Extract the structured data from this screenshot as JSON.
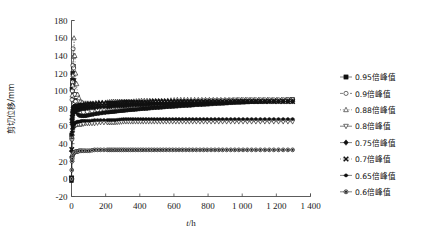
{
  "chart_data": {
    "type": "line",
    "title": "",
    "xlabel": "t/h",
    "ylabel": "剪切位移/mm",
    "xlim": [
      0,
      1400
    ],
    "ylim": [
      -20,
      180
    ],
    "xticks": [
      0,
      200,
      400,
      600,
      800,
      1000,
      1200,
      1400
    ],
    "xtick_labels": [
      "0",
      "200",
      "400",
      "600",
      "800",
      "1 000",
      "1 200",
      "1 400"
    ],
    "yticks": [
      -20,
      0,
      20,
      40,
      60,
      80,
      100,
      120,
      140,
      160,
      180
    ],
    "ytick_labels": [
      "-20",
      "0",
      "20",
      "40",
      "60",
      "80",
      "100",
      "120",
      "140",
      "160",
      "180"
    ],
    "grid": false,
    "legend_position": "right",
    "series": [
      {
        "name": "0.95倍峰值",
        "marker": "filled-square",
        "line": "solid",
        "x": [
          0,
          3,
          6,
          10,
          16,
          24,
          34,
          46,
          60,
          80,
          105,
          135,
          170,
          210,
          255,
          305,
          360,
          420,
          485,
          555,
          630,
          710,
          795,
          885,
          980,
          1080,
          1185,
          1295
        ],
        "y": [
          -2,
          102,
          112,
          128,
          96,
          82,
          76,
          73,
          72,
          72,
          73,
          74,
          75,
          76,
          77,
          78,
          79,
          80,
          81,
          82,
          83,
          84,
          85,
          86,
          87,
          88,
          89,
          90
        ]
      },
      {
        "name": "0.9倍峰值",
        "marker": "open-circle",
        "line": "dashed",
        "x": [
          0,
          3,
          6,
          10,
          16,
          24,
          34,
          46,
          60,
          80,
          105,
          135,
          170,
          210,
          255,
          305,
          360,
          420,
          485,
          555,
          630,
          710,
          795,
          885,
          980,
          1080,
          1185,
          1295
        ],
        "y": [
          0,
          90,
          110,
          148,
          104,
          88,
          80,
          77,
          76,
          76,
          77,
          78,
          79,
          80,
          81,
          82,
          83,
          84,
          85,
          86,
          87,
          88,
          89,
          89,
          90,
          90,
          90,
          90
        ]
      },
      {
        "name": "0.88倍峰值",
        "marker": "open-triangle-up",
        "line": "dotted",
        "x": [
          0,
          4,
          9,
          15,
          24,
          36,
          52,
          72,
          96,
          125,
          160,
          200,
          245,
          295,
          350,
          410,
          475,
          545,
          620,
          700,
          785,
          875,
          970,
          1070,
          1175,
          1285
        ],
        "y": [
          2,
          95,
          118,
          160,
          120,
          96,
          88,
          86,
          86,
          86,
          87,
          87,
          88,
          88,
          88,
          89,
          89,
          89,
          90,
          90,
          90,
          90,
          90,
          90,
          90,
          90
        ]
      },
      {
        "name": "0.8倍峰值",
        "marker": "open-triangle-down",
        "line": "solid",
        "x": [
          0,
          3,
          6,
          10,
          16,
          24,
          34,
          46,
          60,
          80,
          105,
          135,
          170,
          210,
          255,
          305,
          360,
          420,
          485,
          555,
          630,
          710,
          795,
          885,
          980,
          1080,
          1185,
          1295
        ],
        "y": [
          1,
          44,
          52,
          58,
          60,
          61,
          62,
          62,
          62,
          63,
          63,
          63,
          64,
          64,
          64,
          65,
          65,
          65,
          65,
          65,
          65,
          65,
          65,
          65,
          65,
          65,
          65,
          65
        ]
      },
      {
        "name": "0.75倍峰值",
        "marker": "filled-diamond",
        "line": "dash-dot",
        "x": [
          0,
          3,
          6,
          10,
          16,
          24,
          34,
          46,
          60,
          80,
          105,
          135,
          170,
          210,
          255,
          305,
          360,
          420,
          485,
          555,
          630,
          710,
          795,
          885,
          980,
          1080,
          1185,
          1295
        ],
        "y": [
          1,
          62,
          70,
          75,
          77,
          78,
          79,
          79,
          80,
          80,
          81,
          81,
          82,
          82,
          83,
          83,
          84,
          84,
          85,
          85,
          86,
          86,
          87,
          87,
          88,
          88,
          88,
          88
        ]
      },
      {
        "name": "0.7倍峰值",
        "marker": "filled-x",
        "line": "dotted",
        "x": [
          0,
          3,
          6,
          10,
          16,
          24,
          34,
          46,
          60,
          80,
          105,
          135,
          170,
          210,
          255,
          305,
          360,
          420,
          485,
          555,
          630,
          710,
          795,
          885,
          980,
          1080,
          1185,
          1295
        ],
        "y": [
          1,
          66,
          74,
          79,
          81,
          82,
          83,
          83,
          84,
          84,
          85,
          85,
          86,
          86,
          86,
          87,
          87,
          87,
          88,
          88,
          88,
          88,
          88,
          88,
          88,
          88,
          88,
          88
        ]
      },
      {
        "name": "0.65倍峰值",
        "marker": "filled-circle-small",
        "line": "solid",
        "x": [
          0,
          3,
          6,
          10,
          16,
          24,
          34,
          46,
          60,
          80,
          105,
          135,
          170,
          210,
          255,
          305,
          360,
          420,
          485,
          555,
          630,
          710,
          795,
          885,
          980,
          1080,
          1185,
          1295
        ],
        "y": [
          1,
          50,
          57,
          61,
          63,
          64,
          65,
          65,
          66,
          66,
          66,
          67,
          67,
          67,
          67,
          68,
          68,
          68,
          68,
          68,
          68,
          68,
          68,
          68,
          68,
          68,
          68,
          68
        ]
      },
      {
        "name": "0.6倍峰值",
        "marker": "filled-circle",
        "line": "dash-dot",
        "x": [
          0,
          3,
          6,
          10,
          16,
          24,
          34,
          46,
          60,
          80,
          105,
          135,
          170,
          210,
          255,
          305,
          360,
          420,
          485,
          555,
          630,
          710,
          795,
          885,
          980,
          1080,
          1185,
          1295
        ],
        "y": [
          0,
          20,
          26,
          29,
          30,
          31,
          31,
          32,
          32,
          32,
          32,
          33,
          33,
          33,
          33,
          33,
          33,
          33,
          33,
          33,
          33,
          33,
          33,
          33,
          33,
          33,
          33,
          33
        ]
      }
    ]
  },
  "legend": {
    "items": [
      {
        "label": "0.95倍峰值",
        "marker": "filled-square"
      },
      {
        "label": "0.9倍峰值",
        "marker": "open-circle"
      },
      {
        "label": "0.88倍峰值",
        "marker": "open-triangle-up"
      },
      {
        "label": "0.8倍峰值",
        "marker": "open-triangle-down"
      },
      {
        "label": "0.75倍峰值",
        "marker": "filled-diamond"
      },
      {
        "label": "0.7倍峰值",
        "marker": "filled-x"
      },
      {
        "label": "0.65倍峰值",
        "marker": "filled-circle-small"
      },
      {
        "label": "0.6倍峰值",
        "marker": "filled-circle"
      }
    ]
  }
}
